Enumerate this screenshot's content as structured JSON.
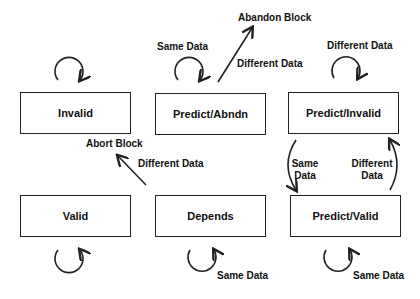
{
  "states": {
    "invalid": "Invalid",
    "predict_abndn": "Predict/Abndn",
    "predict_invalid": "Predict/Invalid",
    "valid": "Valid",
    "depends": "Depends",
    "predict_valid": "Predict/Valid"
  },
  "labels": {
    "abandon_block": "Abandon Block",
    "abort_block": "Abort Block",
    "abndn_same": "Same Data",
    "abndn_different": "Different Data",
    "pinvalid_different": "Different Data",
    "pi_to_pv_same_1": "Same",
    "pi_to_pv_same_2": "Data",
    "pv_to_pi_diff_1": "Different",
    "pv_to_pi_diff_2": "Data",
    "depends_to_abort": "Different Data",
    "depends_same": "Same Data",
    "pvalid_same": "Same Data"
  },
  "colors": {
    "stroke": "#222222",
    "background": "#ffffff"
  }
}
